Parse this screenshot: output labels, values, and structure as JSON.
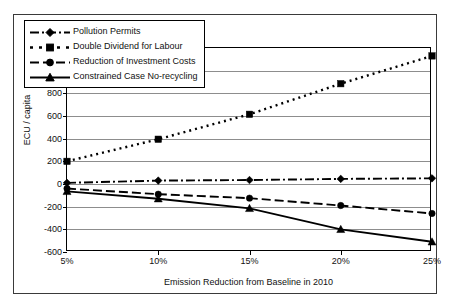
{
  "figure": {
    "caption": ""
  },
  "chart_data": {
    "type": "line",
    "title": "",
    "xlabel": "Emission Reduction from Baseline in 2010",
    "ylabel": "ECU / capita",
    "categories": [
      "5%",
      "10%",
      "15%",
      "20%",
      "25%"
    ],
    "x": [
      5,
      10,
      15,
      20,
      25
    ],
    "xlim": [
      5,
      25
    ],
    "ylim": [
      -600,
      1200
    ],
    "yticks": [
      -600,
      -400,
      -200,
      0,
      200,
      400,
      600,
      800,
      1000,
      1200
    ],
    "xticks": [
      "5%",
      "10%",
      "15%",
      "20%",
      "25%"
    ],
    "grid": true,
    "legend_position": "upper-left-inside",
    "series": [
      {
        "name": "Pollution Permits",
        "values": [
          10,
          30,
          35,
          45,
          50
        ],
        "marker": "diamond",
        "linestyle": "dash-dot",
        "color": "#000000"
      },
      {
        "name": "Double Dividend for Labour",
        "values": [
          200,
          395,
          615,
          885,
          1130
        ],
        "marker": "square",
        "linestyle": "dotted",
        "color": "#000000"
      },
      {
        "name": "Reduction of Investment Costs",
        "values": [
          -40,
          -90,
          -125,
          -190,
          -260
        ],
        "marker": "circle",
        "linestyle": "dashed",
        "color": "#000000"
      },
      {
        "name": "Constrained Case No-recycling",
        "values": [
          -65,
          -130,
          -215,
          -400,
          -510
        ],
        "marker": "triangle",
        "linestyle": "solid",
        "color": "#000000"
      }
    ]
  }
}
